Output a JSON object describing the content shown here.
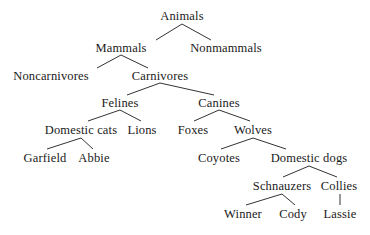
{
  "diagram": {
    "type": "taxonomy-tree",
    "edge_color": "#333333",
    "text_color": "#1a1a1a",
    "background_color": "#ffffff",
    "nodes": [
      {
        "id": "animals",
        "label": "Animals",
        "x": 182,
        "y": 10,
        "level": 0
      },
      {
        "id": "mammals",
        "label": "Mammals",
        "x": 121,
        "y": 42,
        "level": 1
      },
      {
        "id": "nonmammals",
        "label": "Nonmammals",
        "x": 226,
        "y": 42,
        "level": 1
      },
      {
        "id": "noncarnivores",
        "label": "Noncarnivores",
        "x": 51,
        "y": 70,
        "level": 2
      },
      {
        "id": "carnivores",
        "label": "Carnivores",
        "x": 160,
        "y": 70,
        "level": 2
      },
      {
        "id": "felines",
        "label": "Felines",
        "x": 120,
        "y": 97,
        "level": 3
      },
      {
        "id": "canines",
        "label": "Canines",
        "x": 219,
        "y": 97,
        "level": 3
      },
      {
        "id": "domestic-cats",
        "label": "Domestic cats",
        "x": 81,
        "y": 124,
        "level": 4
      },
      {
        "id": "lions",
        "label": "Lions",
        "x": 142,
        "y": 124,
        "level": 4
      },
      {
        "id": "foxes",
        "label": "Foxes",
        "x": 193,
        "y": 124,
        "level": 4
      },
      {
        "id": "wolves",
        "label": "Wolves",
        "x": 253,
        "y": 124,
        "level": 4
      },
      {
        "id": "garfield",
        "label": "Garfield",
        "x": 45,
        "y": 152,
        "level": 5
      },
      {
        "id": "abbie",
        "label": "Abbie",
        "x": 94,
        "y": 152,
        "level": 5
      },
      {
        "id": "coyotes",
        "label": "Coyotes",
        "x": 219,
        "y": 152,
        "level": 5
      },
      {
        "id": "domestic-dogs",
        "label": "Domestic dogs",
        "x": 309,
        "y": 152,
        "level": 5
      },
      {
        "id": "schnauzers",
        "label": "Schnauzers",
        "x": 282,
        "y": 180,
        "level": 6
      },
      {
        "id": "collies",
        "label": "Collies",
        "x": 339,
        "y": 180,
        "level": 6
      },
      {
        "id": "winner",
        "label": "Winner",
        "x": 243,
        "y": 208,
        "level": 7
      },
      {
        "id": "cody",
        "label": "Cody",
        "x": 293,
        "y": 208,
        "level": 7
      },
      {
        "id": "lassie",
        "label": "Lassie",
        "x": 340,
        "y": 208,
        "level": 7
      }
    ],
    "edges": [
      {
        "from": "animals",
        "to": "mammals",
        "x1": 182,
        "y1": 24,
        "x2": 156,
        "y2": 40
      },
      {
        "from": "animals",
        "to": "nonmammals",
        "x1": 182,
        "y1": 24,
        "x2": 211,
        "y2": 40
      },
      {
        "from": "mammals",
        "to": "noncarnivores",
        "x1": 121,
        "y1": 55,
        "x2": 97,
        "y2": 68
      },
      {
        "from": "mammals",
        "to": "carnivores",
        "x1": 121,
        "y1": 55,
        "x2": 148,
        "y2": 68
      },
      {
        "from": "carnivores",
        "to": "felines",
        "x1": 160,
        "y1": 83,
        "x2": 127,
        "y2": 95
      },
      {
        "from": "carnivores",
        "to": "canines",
        "x1": 160,
        "y1": 83,
        "x2": 214,
        "y2": 95
      },
      {
        "from": "felines",
        "to": "domestic-cats",
        "x1": 120,
        "y1": 110,
        "x2": 88,
        "y2": 121
      },
      {
        "from": "felines",
        "to": "lions",
        "x1": 120,
        "y1": 110,
        "x2": 141,
        "y2": 121
      },
      {
        "from": "canines",
        "to": "foxes",
        "x1": 219,
        "y1": 110,
        "x2": 194,
        "y2": 121
      },
      {
        "from": "canines",
        "to": "wolves",
        "x1": 219,
        "y1": 110,
        "x2": 250,
        "y2": 121
      },
      {
        "from": "domestic-cats",
        "to": "garfield",
        "x1": 81,
        "y1": 138,
        "x2": 47,
        "y2": 149
      },
      {
        "from": "domestic-cats",
        "to": "abbie",
        "x1": 81,
        "y1": 138,
        "x2": 93,
        "y2": 149
      },
      {
        "from": "wolves",
        "to": "coyotes",
        "x1": 253,
        "y1": 138,
        "x2": 221,
        "y2": 149
      },
      {
        "from": "wolves",
        "to": "domestic-dogs",
        "x1": 253,
        "y1": 138,
        "x2": 286,
        "y2": 149
      },
      {
        "from": "domestic-dogs",
        "to": "schnauzers",
        "x1": 309,
        "y1": 166,
        "x2": 283,
        "y2": 177
      },
      {
        "from": "domestic-dogs",
        "to": "collies",
        "x1": 309,
        "y1": 166,
        "x2": 337,
        "y2": 177
      },
      {
        "from": "schnauzers",
        "to": "winner",
        "x1": 282,
        "y1": 194,
        "x2": 246,
        "y2": 205
      },
      {
        "from": "schnauzers",
        "to": "cody",
        "x1": 282,
        "y1": 194,
        "x2": 295,
        "y2": 205
      },
      {
        "from": "collies",
        "to": "lassie",
        "x1": 340,
        "y1": 194,
        "x2": 340,
        "y2": 205
      }
    ]
  }
}
